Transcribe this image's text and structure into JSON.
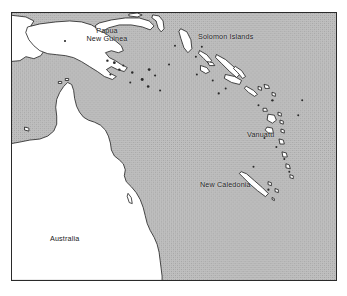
{
  "map": {
    "title": "Southwest Pacific region map",
    "projection_note": "",
    "frame": {
      "border_color": "#2a2a2a",
      "land_color": "#ffffff",
      "ocean_color": "#b9b9b9"
    },
    "labels": {
      "papua_new_guinea": {
        "line1": "Papua",
        "line2": "New Guinea"
      },
      "solomon_islands": "Solomon Islands",
      "vanuatu": "Vanuatu",
      "new_caledonia": "New Caledonia",
      "australia": "Australia"
    },
    "markers": [
      {
        "name": "port-moresby-dot",
        "label": ""
      }
    ],
    "legend": [],
    "colors": {
      "ocean": "#b9b9b9",
      "ocean_dither_dark": "#a6a6a6",
      "land": "#ffffff",
      "coastline": "#1e1e1e",
      "text": "#1a1a1a",
      "frame": "#2a2a2a",
      "page_background": "#ffffff"
    }
  }
}
